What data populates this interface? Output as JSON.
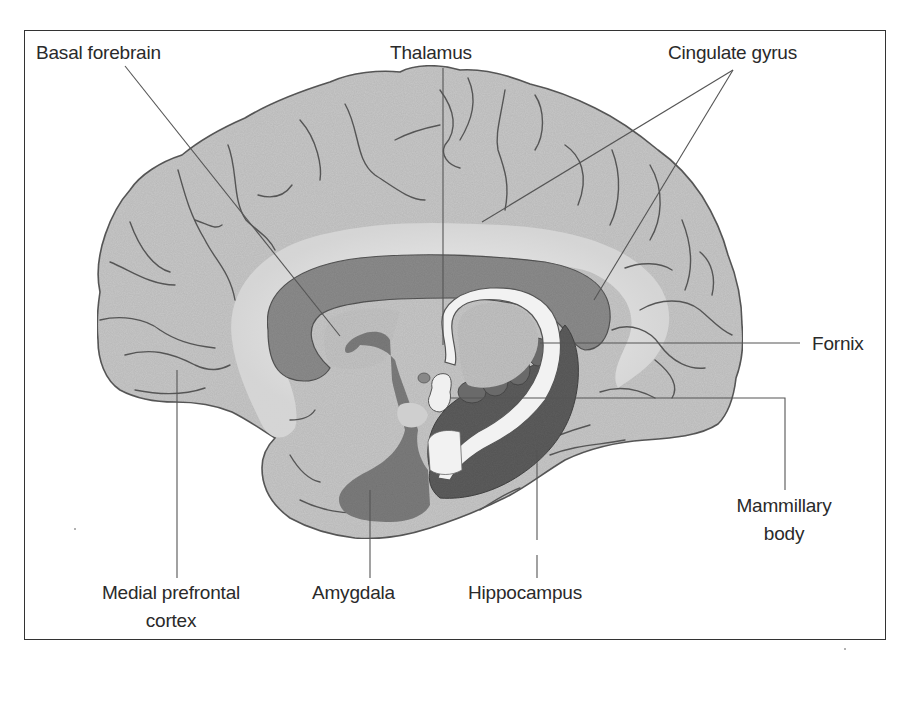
{
  "figure": {
    "labels": {
      "basal_forebrain": "Basal forebrain",
      "thalamus": "Thalamus",
      "cingulate_gyrus": "Cingulate gyrus",
      "fornix": "Fornix",
      "mammillary_body_line1": "Mammillary",
      "mammillary_body_line2": "body",
      "medial_prefrontal_line1": "Medial prefrontal",
      "medial_prefrontal_line2": "cortex",
      "amygdala": "Amygdala",
      "hippocampus": "Hippocampus"
    },
    "colors": {
      "background": "#ffffff",
      "cortex": "#c9c9c9",
      "white_matter": "#ececec",
      "corpus_callosum": "#8e8e8e",
      "thalamus": "#bdbdbd",
      "fornix": "#f1f1f1",
      "hippocampus": "#5f5f5f",
      "amygdala_basal": "#7f7f7f",
      "outline": "#555555",
      "leader_line": "#555555",
      "text": "#2a2a2a",
      "frame": "#333333"
    }
  }
}
